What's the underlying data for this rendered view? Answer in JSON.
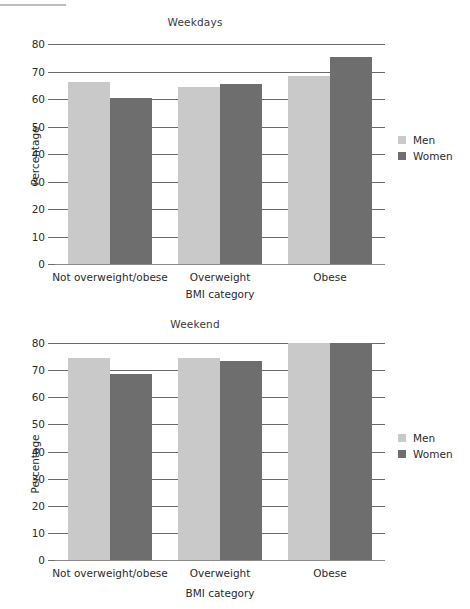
{
  "figure": {
    "decorative_rule_color": "#bdbdbd",
    "colors": {
      "men": "#c9c9c9",
      "women": "#6e6e6e",
      "gridline": "#6b6b6b",
      "text": "#2b2b2b"
    }
  },
  "legend": {
    "position": "right",
    "entries": [
      {
        "label": "Men",
        "color": "#c9c9c9"
      },
      {
        "label": "Women",
        "color": "#6e6e6e"
      }
    ]
  },
  "chart_data": [
    {
      "type": "bar",
      "title": "Weekdays",
      "xlabel": "BMI category",
      "ylabel": "Percentage",
      "categories": [
        "Not overweight/obese",
        "Overweight",
        "Obese"
      ],
      "series": [
        {
          "name": "Men",
          "values": [
            66.3,
            64.3,
            68.3
          ]
        },
        {
          "name": "Women",
          "values": [
            60.2,
            65.3,
            75.3
          ]
        }
      ],
      "ylim": [
        0,
        80
      ],
      "yticks": [
        0,
        10,
        20,
        30,
        40,
        50,
        60,
        70,
        80
      ],
      "grid": true,
      "legend": [
        "Men",
        "Women"
      ]
    },
    {
      "type": "bar",
      "title": "Weekend",
      "xlabel": "BMI category",
      "ylabel": "Percentage",
      "categories": [
        "Not overweight/obese",
        "Overweight",
        "Obese"
      ],
      "series": [
        {
          "name": "Men",
          "values": [
            74.5,
            74.5,
            80.0
          ]
        },
        {
          "name": "Women",
          "values": [
            68.5,
            73.5,
            80.0
          ]
        }
      ],
      "ylim": [
        0,
        80
      ],
      "yticks": [
        0,
        10,
        20,
        30,
        40,
        50,
        60,
        70,
        80
      ],
      "grid": true,
      "legend": [
        "Men",
        "Women"
      ]
    }
  ]
}
